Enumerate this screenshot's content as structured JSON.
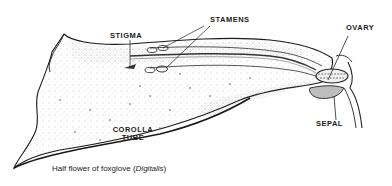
{
  "diagram": {
    "title": "Half flower of foxglove",
    "caption_prefix": "Half flower of foxglove (",
    "caption_italic": "Digitalis",
    "caption_suffix": ")",
    "labels": {
      "stigma": "STIGMA",
      "stamens": "STAMENS",
      "ovary": "OVARY",
      "corolla_line1": "COROLLA",
      "corolla_line2": "TUBE",
      "sepal": "SEPAL"
    },
    "colors": {
      "ink": "#1a1a1a",
      "shade": "#9a9a9a",
      "background": "#ffffff"
    }
  }
}
